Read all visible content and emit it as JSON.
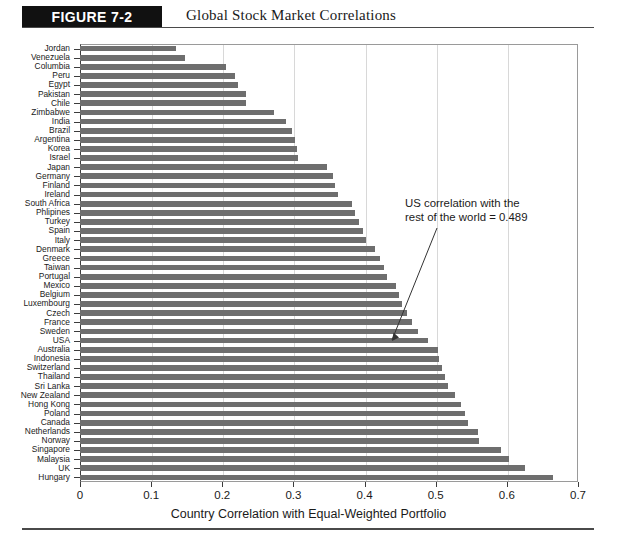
{
  "figure": {
    "badge": "FIGURE 7-2",
    "title": "Global Stock Market Correlations"
  },
  "annotation": {
    "line1": "US correlation with the",
    "line2": "rest of the world = 0.489"
  },
  "chart_data": {
    "type": "bar",
    "orientation": "horizontal",
    "title": "Global Stock Market Correlations",
    "xlabel": "Country Correlation with Equal-Weighted Portfolio",
    "ylabel": "",
    "xlim": [
      0,
      0.7
    ],
    "xticks": [
      "0",
      "0.1",
      "0.2",
      "0.3",
      "0.4",
      "0.5",
      "0.6",
      "0.7"
    ],
    "xtick_values": [
      0,
      0.1,
      0.2,
      0.3,
      0.4,
      0.5,
      0.6,
      0.7
    ],
    "grid": true,
    "legend": false,
    "bar_color": "#6e6e6e",
    "categories": [
      "Jordan",
      "Venezuela",
      "Columbia",
      "Peru",
      "Egypt",
      "Pakistan",
      "Chile",
      "Zimbabwe",
      "India",
      "Brazil",
      "Argentina",
      "Korea",
      "Israel",
      "Japan",
      "Germany",
      "Finland",
      "Ireland",
      "South Africa",
      "Phlipines",
      "Turkey",
      "Spain",
      "Italy",
      "Denmark",
      "Greece",
      "Taiwan",
      "Portugal",
      "Mexico",
      "Belgium",
      "Luxembourg",
      "Czech",
      "France",
      "Sweden",
      "USA",
      "Australia",
      "Indonesia",
      "Switzerland",
      "Thailand",
      "Sri Lanka",
      "New Zealand",
      "Hong Kong",
      "Poland",
      "Canada",
      "Netherlands",
      "Norway",
      "Singapore",
      "Malaysia",
      "UK",
      "Hungary"
    ],
    "values": [
      0.135,
      0.147,
      0.205,
      0.218,
      0.222,
      0.233,
      0.234,
      0.272,
      0.29,
      0.298,
      0.302,
      0.305,
      0.307,
      0.347,
      0.355,
      0.358,
      0.363,
      0.383,
      0.387,
      0.392,
      0.398,
      0.402,
      0.414,
      0.421,
      0.428,
      0.432,
      0.444,
      0.449,
      0.452,
      0.459,
      0.466,
      0.475,
      0.489,
      0.503,
      0.505,
      0.509,
      0.513,
      0.517,
      0.527,
      0.536,
      0.541,
      0.546,
      0.56,
      0.561,
      0.592,
      0.603,
      0.625,
      0.665
    ],
    "annotation": {
      "text": "US correlation with the rest of the world = 0.489",
      "points_to_category": "USA",
      "points_to_value": 0.489
    }
  }
}
